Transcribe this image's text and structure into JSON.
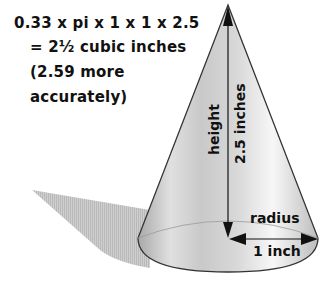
{
  "formula": {
    "line1": "0.33 x pi x 1 x 1 x 2.5",
    "line2": "= 2½ cubic inches",
    "line3": "(2.59 more",
    "line4": "accurately)"
  },
  "labels": {
    "height": "height",
    "height_value": "2.5 inches",
    "radius": "radius",
    "radius_value": "1 inch"
  },
  "colors": {
    "outline": "#333333",
    "shadow": "#c4c4c4",
    "cone_light": "#f4f4f4",
    "cone_mid": "#d2d2d2",
    "cone_dark": "#a8a8a8",
    "text": "#111111"
  }
}
